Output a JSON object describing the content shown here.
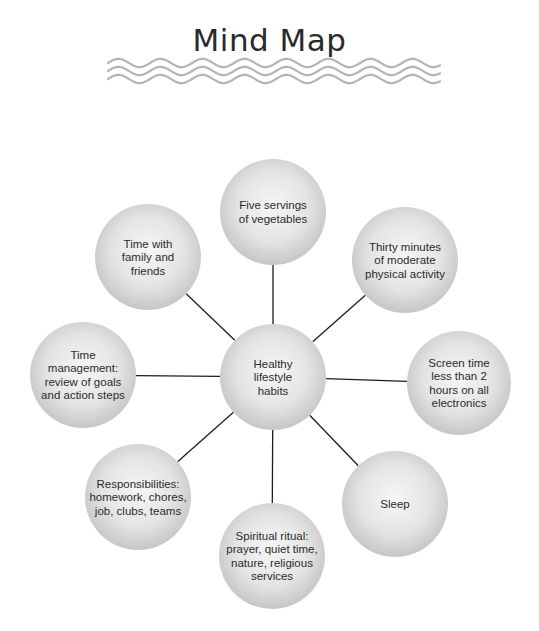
{
  "title": "Mind Map",
  "center": {
    "id": "healthy-lifestyle-habits",
    "lines": [
      "Healthy",
      "lifestyle",
      "habits"
    ]
  },
  "nodes": [
    {
      "id": "five-servings",
      "lines": [
        "Five servings",
        "of vegetables"
      ]
    },
    {
      "id": "thirty-minutes",
      "lines": [
        "Thirty minutes",
        "of moderate",
        "physical activity"
      ]
    },
    {
      "id": "screen-time",
      "lines": [
        "Screen time",
        "less than 2",
        "hours on all",
        "electronics"
      ]
    },
    {
      "id": "sleep",
      "lines": [
        "Sleep"
      ]
    },
    {
      "id": "spiritual-ritual",
      "lines": [
        "Spiritual ritual:",
        "prayer, quiet time,",
        "nature, religious",
        "services"
      ]
    },
    {
      "id": "responsibilities",
      "lines": [
        "Responsibilities:",
        "homework, chores,",
        "job, clubs, teams"
      ]
    },
    {
      "id": "time-management",
      "lines": [
        "Time",
        "management:",
        "review of goals",
        "and action steps"
      ]
    },
    {
      "id": "time-with-family",
      "lines": [
        "Time with",
        "family and",
        "friends"
      ]
    }
  ],
  "colors": {
    "line": "#1e1e1e",
    "wave": "#b4b4b4",
    "bubble_light": "#f4f4f4",
    "bubble_dark": "#c9c9c9",
    "text": "#2b2b2b"
  }
}
